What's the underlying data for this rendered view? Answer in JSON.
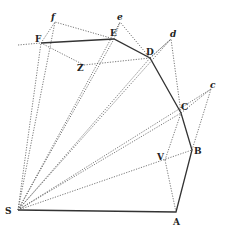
{
  "diagram": {
    "title": "",
    "points": {
      "S": {
        "label": "S",
        "x": 18,
        "y": 210
      },
      "A": {
        "label": "A",
        "x": 176,
        "y": 212
      },
      "B": {
        "label": "B",
        "x": 192,
        "y": 150
      },
      "V": {
        "label": "V",
        "x": 165,
        "y": 160
      },
      "C": {
        "label": "C",
        "x": 181,
        "y": 113
      },
      "c": {
        "label": "c",
        "x": 211,
        "y": 89
      },
      "D": {
        "label": "D",
        "x": 150,
        "y": 58
      },
      "d": {
        "label": "d",
        "x": 171,
        "y": 39
      },
      "E": {
        "label": "E",
        "x": 114,
        "y": 39
      },
      "e": {
        "label": "e",
        "x": 120,
        "y": 22
      },
      "F": {
        "label": "F",
        "x": 41,
        "y": 43
      },
      "f": {
        "label": "f",
        "x": 55,
        "y": 22
      },
      "Z": {
        "label": "Z",
        "x": 84,
        "y": 65
      }
    }
  }
}
